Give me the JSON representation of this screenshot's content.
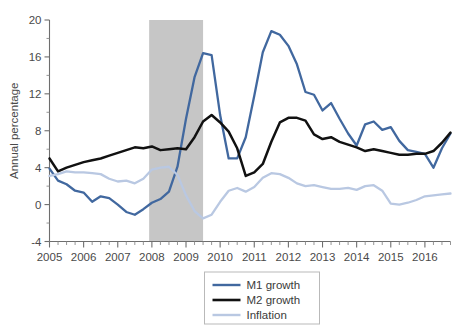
{
  "chart_data": {
    "type": "line",
    "title": "",
    "subtitle": "",
    "xlabel": "",
    "ylabel": "Annual percentage",
    "xlim": [
      2005.0,
      2016.75
    ],
    "ylim": [
      -4,
      20
    ],
    "yticks": [
      -4,
      0,
      4,
      8,
      12,
      16,
      20
    ],
    "ytick_labels": [
      "-4",
      "0",
      "4",
      "8",
      "12",
      "16",
      "20"
    ],
    "xticks": [
      2005,
      2006,
      2007,
      2008,
      2009,
      2010,
      2011,
      2012,
      2013,
      2014,
      2015,
      2016
    ],
    "xtick_labels": [
      "2005",
      "2006",
      "2007",
      "2008",
      "2009",
      "2010",
      "2011",
      "2012",
      "2013",
      "2014",
      "2015",
      "2016"
    ],
    "minor_xticks_per_year": 4,
    "minor_yticks_per_major": 2,
    "grid": false,
    "legend_position": "bottom-center",
    "shaded_regions": [
      {
        "name": "recession",
        "x_start": 2007.92,
        "x_end": 2009.5,
        "color": "#c6c6c6"
      }
    ],
    "series": [
      {
        "name": "M1 growth",
        "color": "#41689f",
        "width": 2.3,
        "x": [
          2005.0,
          2005.25,
          2005.5,
          2005.75,
          2006.0,
          2006.25,
          2006.5,
          2006.75,
          2007.0,
          2007.25,
          2007.5,
          2007.75,
          2008.0,
          2008.25,
          2008.5,
          2008.75,
          2009.0,
          2009.25,
          2009.5,
          2009.75,
          2010.0,
          2010.25,
          2010.5,
          2010.75,
          2011.0,
          2011.25,
          2011.5,
          2011.75,
          2012.0,
          2012.25,
          2012.5,
          2012.75,
          2013.0,
          2013.25,
          2013.5,
          2013.75,
          2014.0,
          2014.25,
          2014.5,
          2014.75,
          2015.0,
          2015.25,
          2015.5,
          2015.75,
          2016.0,
          2016.25,
          2016.5,
          2016.75
        ],
        "values": [
          3.9,
          2.6,
          2.2,
          1.5,
          1.3,
          0.3,
          0.9,
          0.7,
          0.0,
          -0.8,
          -1.1,
          -0.5,
          0.2,
          0.6,
          1.4,
          4.1,
          9.3,
          13.8,
          16.4,
          16.2,
          9.7,
          5.0,
          5.0,
          7.3,
          11.8,
          16.5,
          18.8,
          18.4,
          17.2,
          15.2,
          12.2,
          11.9,
          10.2,
          11.0,
          9.3,
          7.7,
          6.4,
          8.7,
          9.0,
          8.1,
          8.4,
          6.9,
          5.9,
          5.7,
          5.5,
          4.0,
          6.1,
          7.7
        ]
      },
      {
        "name": "M2 growth",
        "color": "#111111",
        "width": 2.5,
        "x": [
          2005.0,
          2005.25,
          2005.5,
          2005.75,
          2006.0,
          2006.25,
          2006.5,
          2006.75,
          2007.0,
          2007.25,
          2007.5,
          2007.75,
          2008.0,
          2008.25,
          2008.5,
          2008.75,
          2009.0,
          2009.25,
          2009.5,
          2009.75,
          2010.0,
          2010.25,
          2010.5,
          2010.75,
          2011.0,
          2011.25,
          2011.5,
          2011.75,
          2012.0,
          2012.25,
          2012.5,
          2012.75,
          2013.0,
          2013.25,
          2013.5,
          2013.75,
          2014.0,
          2014.25,
          2014.5,
          2014.75,
          2015.0,
          2015.25,
          2015.5,
          2015.75,
          2016.0,
          2016.25,
          2016.5,
          2016.75
        ],
        "values": [
          5.0,
          3.6,
          4.0,
          4.3,
          4.6,
          4.8,
          5.0,
          5.3,
          5.6,
          5.9,
          6.2,
          6.1,
          6.3,
          5.9,
          6.0,
          6.1,
          6.0,
          7.3,
          9.0,
          9.7,
          8.9,
          7.9,
          6.1,
          3.1,
          3.5,
          4.4,
          6.8,
          8.9,
          9.4,
          9.4,
          9.1,
          7.6,
          7.1,
          7.3,
          6.8,
          6.5,
          6.2,
          5.8,
          6.0,
          5.8,
          5.6,
          5.4,
          5.4,
          5.5,
          5.5,
          5.8,
          6.7,
          7.8
        ]
      },
      {
        "name": "Inflation",
        "color": "#b9c8e2",
        "width": 2.3,
        "x": [
          2005.0,
          2005.25,
          2005.5,
          2005.75,
          2006.0,
          2006.25,
          2006.5,
          2006.75,
          2007.0,
          2007.25,
          2007.5,
          2007.75,
          2008.0,
          2008.25,
          2008.5,
          2008.75,
          2009.0,
          2009.25,
          2009.5,
          2009.75,
          2010.0,
          2010.25,
          2010.5,
          2010.75,
          2011.0,
          2011.25,
          2011.5,
          2011.75,
          2012.0,
          2012.25,
          2012.5,
          2012.75,
          2013.0,
          2013.25,
          2013.5,
          2013.75,
          2014.0,
          2014.25,
          2014.5,
          2014.75,
          2015.0,
          2015.25,
          2015.5,
          2015.75,
          2016.0,
          2016.25,
          2016.5,
          2016.75
        ],
        "values": [
          3.1,
          3.3,
          3.6,
          3.5,
          3.5,
          3.4,
          3.3,
          2.8,
          2.5,
          2.6,
          2.3,
          2.8,
          3.8,
          4.0,
          4.1,
          3.2,
          1.0,
          -0.7,
          -1.5,
          -1.1,
          0.3,
          1.5,
          1.8,
          1.4,
          1.9,
          2.9,
          3.4,
          3.3,
          2.9,
          2.3,
          2.0,
          2.1,
          1.9,
          1.7,
          1.7,
          1.8,
          1.6,
          2.0,
          2.1,
          1.5,
          0.1,
          0.0,
          0.2,
          0.5,
          0.9,
          1.0,
          1.1,
          1.2
        ]
      }
    ],
    "legend": [
      {
        "label": "M1 growth",
        "color": "#41689f"
      },
      {
        "label": "M2 growth",
        "color": "#111111"
      },
      {
        "label": "Inflation",
        "color": "#b9c8e2"
      }
    ]
  },
  "axis": {
    "ylabel": "Annual percentage"
  }
}
